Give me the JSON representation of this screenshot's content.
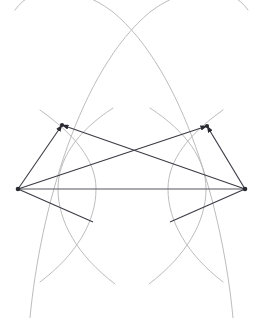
{
  "figure": {
    "canvas": {
      "width": 261,
      "height": 318
    },
    "colors": {
      "background": "#ffffff",
      "arc_stroke": "#b4b4b4",
      "vector_stroke": "#3c3c46",
      "baseline_stroke": "#55555f",
      "vertex_fill": "#2a2a32"
    }
  },
  "chart_data": {
    "type": "scatter",
    "xlabel": "",
    "ylabel": "",
    "xlim": [
      0,
      261
    ],
    "ylim": [
      0,
      318
    ],
    "grid": false,
    "legend": "none",
    "points": [
      {
        "name": "top-left-vertex",
        "x": 62,
        "y": 125
      },
      {
        "name": "top-right-vertex",
        "x": 207,
        "y": 126
      },
      {
        "name": "left-vertex",
        "x": 18,
        "y": 189
      },
      {
        "name": "right-vertex",
        "x": 245,
        "y": 189
      }
    ],
    "segments": [
      {
        "name": "left-to-top-left",
        "from": "left-vertex",
        "to": "top-left-vertex",
        "arrow": "end"
      },
      {
        "name": "right-to-top-right",
        "from": "right-vertex",
        "to": "top-right-vertex",
        "arrow": "end"
      },
      {
        "name": "left-to-top-right",
        "from": "left-vertex",
        "to": "top-right-vertex",
        "arrow": "end"
      },
      {
        "name": "right-to-top-left",
        "from": "right-vertex",
        "to": "top-left-vertex",
        "arrow": "end"
      },
      {
        "name": "left-to-right-baseline",
        "from": "left-vertex",
        "to": "right-vertex",
        "arrow": "none"
      },
      {
        "name": "left-lower-spur",
        "from": "left-vertex",
        "to": "lower-left-arc-point",
        "arrow": "none"
      },
      {
        "name": "right-lower-spur",
        "from": "right-vertex",
        "to": "lower-right-arc-point",
        "arrow": "none"
      }
    ],
    "spur_endpoints": [
      {
        "name": "lower-left-arc-point",
        "x": 93,
        "y": 222
      },
      {
        "name": "lower-right-arc-point",
        "x": 170,
        "y": 222
      }
    ],
    "arc_intersections": [
      {
        "name": "top-crossing",
        "x": 132,
        "y": 15
      },
      {
        "name": "bottom-left-crossing",
        "x": 57,
        "y": 272
      },
      {
        "name": "bottom-right-crossing",
        "x": 205,
        "y": 272
      }
    ],
    "arcs": [
      {
        "name": "large-arc-left-sweeping-right",
        "center_x": 18,
        "center_y": 189,
        "radius": 230
      },
      {
        "name": "large-arc-right-sweeping-left",
        "center_x": 245,
        "center_y": 189,
        "radius": 230
      },
      {
        "name": "left-lens-outer-arc",
        "center_x": 18,
        "center_y": 189,
        "radius": 78
      },
      {
        "name": "left-lens-inner-arc",
        "center_x": 145,
        "center_y": 189,
        "radius": 78
      },
      {
        "name": "right-lens-outer-arc",
        "center_x": 245,
        "center_y": 189,
        "radius": 78
      },
      {
        "name": "right-lens-inner-arc",
        "center_x": 118,
        "center_y": 189,
        "radius": 78
      }
    ],
    "lens_extents": {
      "left_lens_left_x": 58,
      "left_lens_right_x": 96,
      "right_lens_left_x": 168,
      "right_lens_right_x": 206,
      "lens_mid_y": 189
    }
  }
}
